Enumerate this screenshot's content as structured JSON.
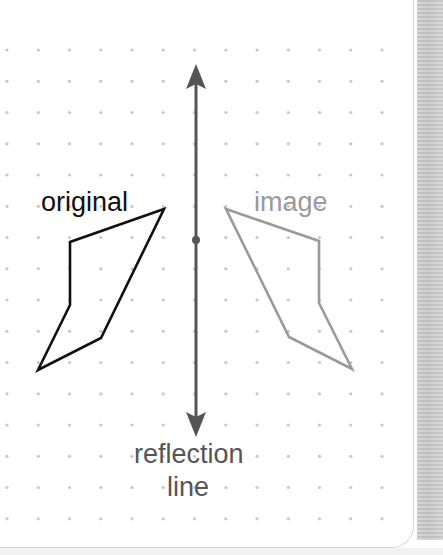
{
  "labels": {
    "original": "original",
    "image": "image",
    "reflection_line_1": "reflection",
    "reflection_line_2": "line"
  },
  "colors": {
    "original_stroke": "#111111",
    "image_stroke": "#9a9a9a",
    "reflection_line": "#555555",
    "grid_dot": "#c8c8c8",
    "original_text": "#111111",
    "image_text": "#9a9a9a",
    "reflection_text": "#555555"
  },
  "grid": {
    "spacing": 31.25,
    "origin_x": 7,
    "origin_y": 50
  },
  "shapes": {
    "original_polygon": "164,209 70,242 70,305 38,370 101,338",
    "image_polygon": "226,209 319,241 319,303 352,369 289,337",
    "reflection_line": {
      "x": 196,
      "y_top": 64,
      "y_bottom": 437,
      "midpoint_y": 240
    }
  }
}
